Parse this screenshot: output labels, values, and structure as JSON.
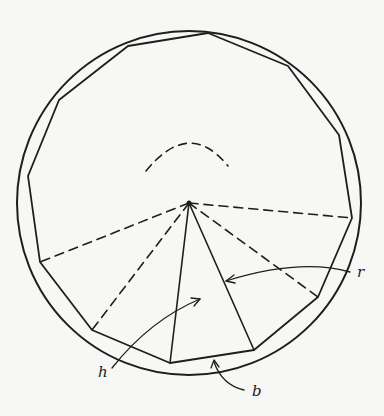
{
  "figure": {
    "colors": {
      "ink": "#1e1e1e",
      "paper": "#f7f7f5"
    },
    "circle": {
      "cx": 189,
      "cy": 203,
      "r": 172
    },
    "center": {
      "x": 189,
      "y": 203
    },
    "polygon_vertices": [
      [
        208,
        33
      ],
      [
        288,
        66
      ],
      [
        339,
        135
      ],
      [
        352,
        218
      ],
      [
        318,
        297
      ],
      [
        254,
        350
      ],
      [
        170,
        363
      ],
      [
        92,
        330
      ],
      [
        40,
        262
      ],
      [
        28,
        176
      ],
      [
        59,
        100
      ],
      [
        128,
        46
      ]
    ],
    "dashed_radii_to": [
      [
        352,
        218
      ],
      [
        318,
        297
      ],
      [
        92,
        330
      ],
      [
        40,
        262
      ]
    ],
    "solid_triangle": {
      "apex": [
        189,
        203
      ],
      "base_left": [
        170,
        363
      ],
      "base_right": [
        254,
        350
      ]
    },
    "labels": {
      "r": {
        "text": "r",
        "x": 357,
        "y": 277
      },
      "h": {
        "text": "h",
        "x": 98,
        "y": 377
      },
      "b": {
        "text": "b",
        "x": 252,
        "y": 396
      }
    }
  }
}
